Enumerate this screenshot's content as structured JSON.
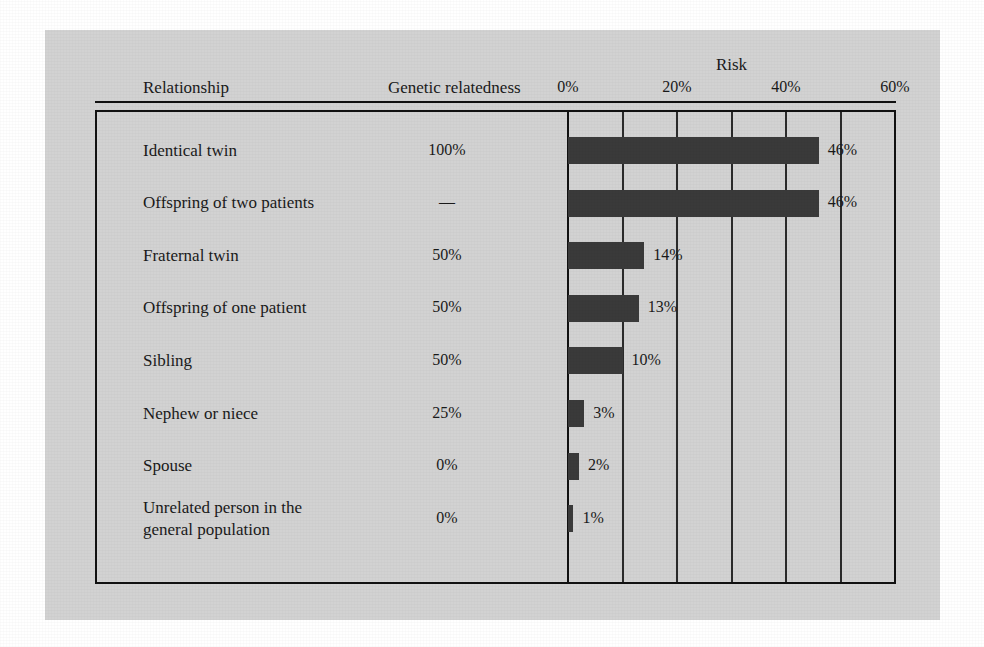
{
  "figure": {
    "background_color": "#ffffff",
    "panel_color": "#d2d2d2",
    "bar_color": "#3a3a3a",
    "axis_color": "#111111"
  },
  "headers": {
    "relationship": "Relationship",
    "relatedness": "Genetic relatedness",
    "risk": "Risk"
  },
  "chart_data": {
    "type": "bar",
    "orientation": "horizontal",
    "title": "Risk",
    "xlabel": "Risk",
    "ylabel": "Relationship",
    "xlim": [
      0,
      60
    ],
    "xticks": [
      0,
      20,
      40,
      60
    ],
    "xticklabels": [
      "0%",
      "20%",
      "40%",
      "60%"
    ],
    "gridlines": [
      0,
      10,
      20,
      30,
      40,
      50,
      60
    ],
    "grid": true,
    "legend": "none",
    "categories": [
      "Identical twin",
      "Offspring of two patients",
      "Fraternal twin",
      "Offspring of one patient",
      "Sibling",
      "Nephew or niece",
      "Spouse",
      "Unrelated person in the general population"
    ],
    "values": [
      46,
      46,
      14,
      13,
      10,
      3,
      2,
      1
    ],
    "value_labels": [
      "46%",
      "46%",
      "14%",
      "13%",
      "10%",
      "3%",
      "2%",
      "1%"
    ],
    "genetic_relatedness": [
      "100%",
      "—",
      "50%",
      "50%",
      "50%",
      "25%",
      "0%",
      "0%"
    ]
  },
  "rows": [
    {
      "label": "Identical twin",
      "relatedness": "100%",
      "value": 46,
      "value_label": "46%"
    },
    {
      "label": "Offspring of two patients",
      "relatedness": "—",
      "value": 46,
      "value_label": "46%"
    },
    {
      "label": "Fraternal twin",
      "relatedness": "50%",
      "value": 14,
      "value_label": "14%"
    },
    {
      "label": "Offspring of one patient",
      "relatedness": "50%",
      "value": 13,
      "value_label": "13%"
    },
    {
      "label": "Sibling",
      "relatedness": "50%",
      "value": 10,
      "value_label": "10%"
    },
    {
      "label": "Nephew or niece",
      "relatedness": "25%",
      "value": 3,
      "value_label": "3%"
    },
    {
      "label": "Spouse",
      "relatedness": "0%",
      "value": 2,
      "value_label": "2%"
    },
    {
      "label": "Unrelated person in the\ngeneral population",
      "relatedness": "0%",
      "value": 1,
      "value_label": "1%"
    }
  ]
}
